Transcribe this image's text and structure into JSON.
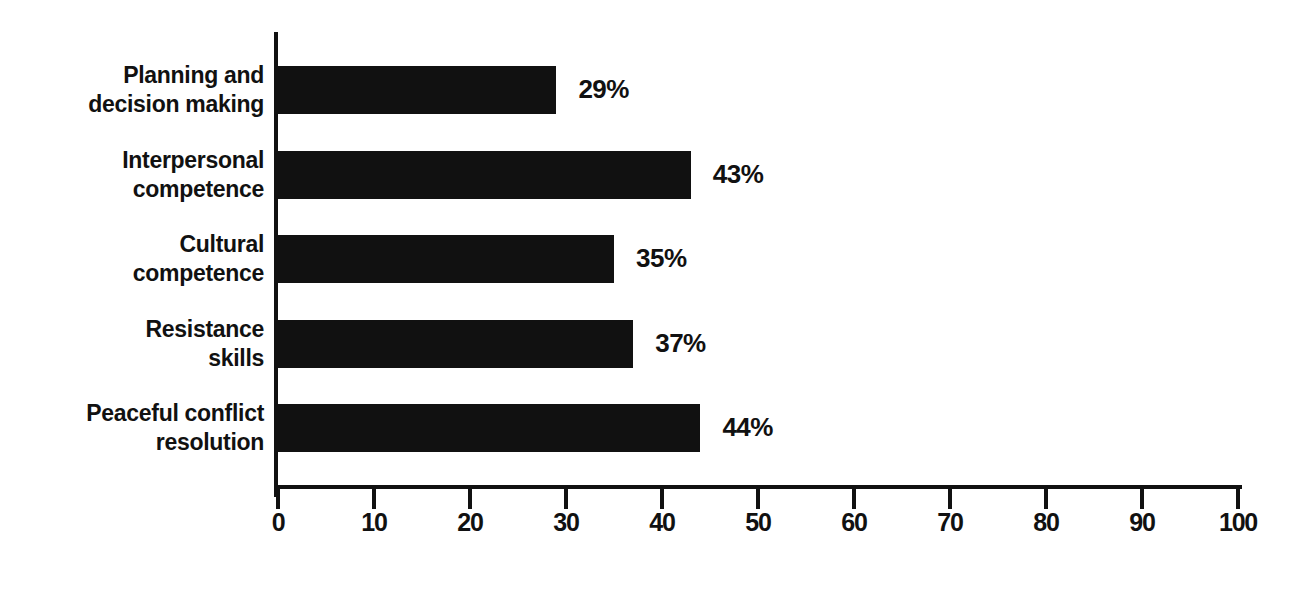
{
  "chart_data": {
    "type": "bar",
    "orientation": "horizontal",
    "title": "",
    "subtitle": "",
    "xlabel": "",
    "ylabel": "",
    "xlim": [
      0,
      100
    ],
    "grid": false,
    "legend": false,
    "legend_position": "none",
    "bar_color": "#111111",
    "x_ticks": [
      0,
      10,
      20,
      30,
      40,
      50,
      60,
      70,
      80,
      90,
      100
    ],
    "x_tick_labels": [
      "0",
      "10",
      "20",
      "30",
      "40",
      "50",
      "60",
      "70",
      "80",
      "90",
      "100"
    ],
    "categories": [
      "Planning and decision making",
      "Interpersonal competence",
      "Cultural competence",
      "Resistance skills",
      "Peaceful conflict resolution"
    ],
    "category_lines": [
      [
        "Planning and",
        "decision making"
      ],
      [
        "Interpersonal",
        "competence"
      ],
      [
        "Cultural",
        "competence"
      ],
      [
        "Resistance",
        "skills"
      ],
      [
        "Peaceful conflict",
        "resolution"
      ]
    ],
    "values": [
      29,
      43,
      35,
      37,
      44
    ],
    "data_labels": [
      "29%",
      "43%",
      "35%",
      "37%",
      "44%"
    ]
  }
}
